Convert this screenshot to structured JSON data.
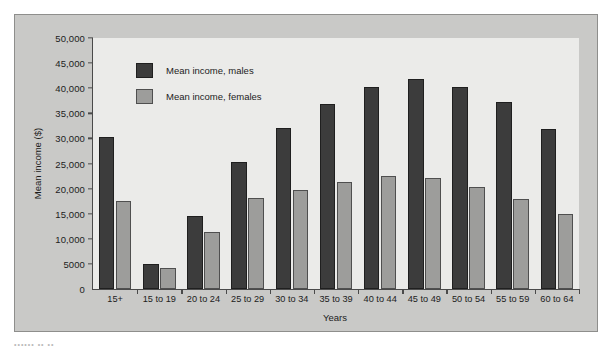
{
  "chart_data": {
    "type": "bar",
    "title": "",
    "xlabel": "Years",
    "ylabel": "Mean income ($)",
    "ylim": [
      0,
      50000
    ],
    "ytick_labels": [
      "0",
      "5000",
      "10,000",
      "15,000",
      "20,000",
      "25,000",
      "30,000",
      "35,000",
      "40,000",
      "45,000",
      "50,000"
    ],
    "ytick_values": [
      0,
      5000,
      10000,
      15000,
      20000,
      25000,
      30000,
      35000,
      40000,
      45000,
      50000
    ],
    "grid": false,
    "legend_position": "upper-left-inside",
    "categories": [
      "15+",
      "15 to 19",
      "20 to 24",
      "25 to 29",
      "30 to 34",
      "35 to 39",
      "40 to 44",
      "45 to 49",
      "50 to 54",
      "55 to 59",
      "60 to 64"
    ],
    "series": [
      {
        "name": "Mean income, males",
        "color": "#3c3c3c",
        "values": [
          30300,
          4900,
          14500,
          25400,
          32100,
          36900,
          40300,
          41800,
          40200,
          37200,
          31800
        ]
      },
      {
        "name": "Mean income, females",
        "color": "#9d9d9b",
        "values": [
          17500,
          4200,
          11400,
          18100,
          19700,
          21300,
          22600,
          22100,
          20400,
          17900,
          14900
        ]
      }
    ]
  },
  "figure": {
    "background_color": "#c9c9c7",
    "plot_background_color": "#ebebe9",
    "axis_color": "#4a4a4a"
  },
  "caption": {
    "text": "•••••• •• ••"
  }
}
